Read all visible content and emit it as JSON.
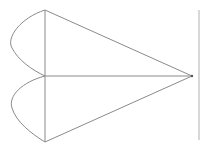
{
  "diagram": {
    "stroke_color": "#8a8a8a",
    "background": "#ffffff",
    "points": {
      "top": [
        45,
        10
      ],
      "middle": [
        45,
        76
      ],
      "bottom": [
        45,
        142
      ],
      "apex": [
        192,
        76
      ]
    },
    "segments": [
      [
        "top",
        "middle"
      ],
      [
        "middle",
        "bottom"
      ],
      [
        "top",
        "apex"
      ],
      [
        "middle",
        "apex"
      ],
      [
        "bottom",
        "apex"
      ]
    ],
    "arcs": [
      {
        "from": "top",
        "to": "middle",
        "bulge_x": 12
      },
      {
        "from": "middle",
        "to": "bottom",
        "bulge_x": 12
      }
    ]
  }
}
